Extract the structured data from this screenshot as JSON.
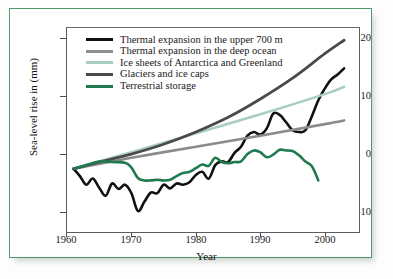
{
  "chart_data": {
    "type": "line",
    "title": "",
    "xlabel": "Year",
    "ylabel": "Sea-level rise in (mm)",
    "xlim": [
      1960,
      2005
    ],
    "ylim": [
      -10,
      23
    ],
    "xticks": [
      1960,
      1970,
      1980,
      1990,
      2000
    ],
    "yticks": [
      -10,
      0,
      10,
      20
    ],
    "grid": false,
    "legend_position": "top-left",
    "series": [
      {
        "name": "Thermal expansion in the upper 700 m",
        "color": "#111111",
        "width": 2.6,
        "x": [
          1961,
          1962,
          1963,
          1964,
          1965,
          1966,
          1967,
          1968,
          1969,
          1970,
          1971,
          1972,
          1973,
          1974,
          1975,
          1976,
          1977,
          1978,
          1979,
          1980,
          1981,
          1982,
          1983,
          1984,
          1985,
          1986,
          1987,
          1988,
          1989,
          1990,
          1991,
          1992,
          1993,
          1994,
          1995,
          1996,
          1997,
          1998,
          1999,
          2000,
          2001,
          2002,
          2003
        ],
        "y": [
          0.0,
          -1.2,
          -2.6,
          -1.6,
          -3.1,
          -4.4,
          -2.4,
          -3.3,
          -2.6,
          -4.0,
          -6.9,
          -5.4,
          -3.9,
          -4.0,
          -2.6,
          -3.2,
          -2.4,
          -2.6,
          -2.2,
          -1.0,
          -0.5,
          -1.6,
          0.6,
          1.2,
          1.1,
          2.6,
          3.6,
          5.4,
          6.0,
          5.6,
          6.6,
          9.0,
          8.8,
          7.6,
          6.3,
          6.0,
          6.3,
          8.6,
          11.2,
          13.1,
          14.6,
          15.4,
          16.4
        ]
      },
      {
        "name": "Thermal expansion in the deep ocean",
        "color": "#8a8a8a",
        "width": 2.6,
        "x": [
          1961,
          1970,
          1980,
          1990,
          2000,
          2003
        ],
        "y": [
          0.0,
          1.8,
          3.6,
          5.4,
          7.3,
          7.9
        ]
      },
      {
        "name": "Ice sheets of Antarctica and Greenland",
        "color": "#a8cfbe",
        "width": 2.6,
        "x": [
          1961,
          1970,
          1980,
          1990,
          2000,
          2003
        ],
        "y": [
          0.0,
          2.7,
          5.8,
          8.9,
          12.2,
          13.4
        ]
      },
      {
        "name": "Glaciers and ice caps",
        "color": "#4a4a4a",
        "width": 2.8,
        "x": [
          1961,
          1965,
          1970,
          1975,
          1980,
          1985,
          1990,
          1995,
          2000,
          2003
        ],
        "y": [
          0.0,
          1.1,
          2.4,
          4.0,
          6.0,
          8.4,
          11.4,
          14.8,
          18.8,
          21.0
        ]
      },
      {
        "name": "Terrestrial storage",
        "color": "#1f7a4d",
        "width": 2.6,
        "x": [
          1961,
          1963,
          1965,
          1967,
          1969,
          1970,
          1971,
          1972,
          1973,
          1974,
          1975,
          1976,
          1977,
          1978,
          1979,
          1980,
          1981,
          1982,
          1983,
          1984,
          1985,
          1986,
          1987,
          1988,
          1989,
          1990,
          1991,
          1992,
          1993,
          1994,
          1995,
          1996,
          1997,
          1998,
          1999
        ],
        "y": [
          0.0,
          0.6,
          1.2,
          1.1,
          1.0,
          0.2,
          -1.5,
          -1.9,
          -1.9,
          -1.8,
          -1.9,
          -1.8,
          -1.2,
          -0.7,
          -0.5,
          0.1,
          0.7,
          0.5,
          1.8,
          1.1,
          0.9,
          1.1,
          1.2,
          2.4,
          3.0,
          2.7,
          1.9,
          2.3,
          3.1,
          3.0,
          2.9,
          2.2,
          1.2,
          0.4,
          -1.9
        ]
      }
    ]
  },
  "axes": {
    "ytick_labels": [
      "20",
      "10",
      "0",
      "-10"
    ],
    "xtick_labels": [
      "1960",
      "1970",
      "1980",
      "1990",
      "2000"
    ],
    "xlabel": "Year",
    "ylabel": "Sea-level rise in (mm)"
  },
  "legend": {
    "items": [
      {
        "label": "Thermal expansion in the upper 700 m",
        "color": "#111111"
      },
      {
        "label": "Thermal expansion in the deep ocean",
        "color": "#8a8a8a"
      },
      {
        "label": "Ice sheets of Antarctica and Greenland",
        "color": "#a8cfbe"
      },
      {
        "label": "Glaciers and ice caps",
        "color": "#4a4a4a"
      },
      {
        "label": "Terrestrial storage",
        "color": "#1f7a4d"
      }
    ]
  }
}
